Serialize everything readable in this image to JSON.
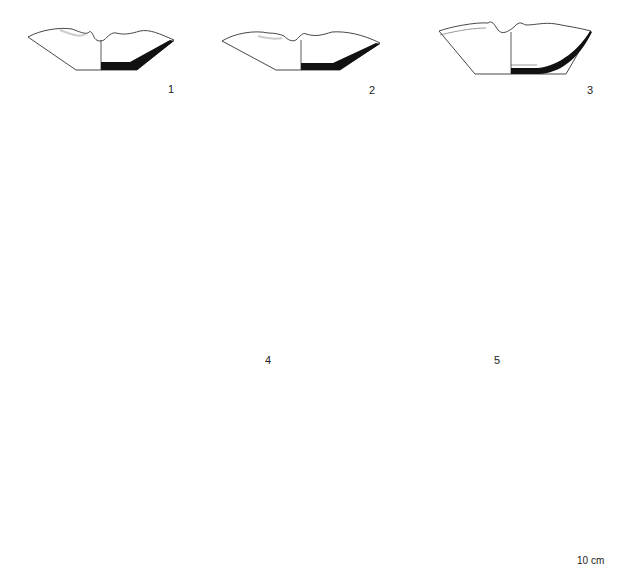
{
  "figure": {
    "type": "archaeological pottery drawing plate",
    "objects": [
      {
        "number": "1",
        "views": [
          "profile-section",
          "plan-top"
        ]
      },
      {
        "number": "2",
        "views": [
          "profile-section",
          "plan-top"
        ]
      },
      {
        "number": "3",
        "views": [
          "profile-section",
          "plan-top"
        ]
      },
      {
        "number": "4",
        "views": [
          "profile-section",
          "plan-top"
        ]
      },
      {
        "number": "5",
        "views": [
          "profile-section",
          "plan-top"
        ]
      }
    ],
    "labels": {
      "n1": "1",
      "n2": "2",
      "n3": "3",
      "n4": "4",
      "n5": "5"
    },
    "scale_bar": {
      "label": "10 cm",
      "style": "alternating black/white segments then solid bar"
    },
    "colors": {
      "background": "#ffffff",
      "line": "#333333",
      "section_fill": "#111111"
    }
  }
}
